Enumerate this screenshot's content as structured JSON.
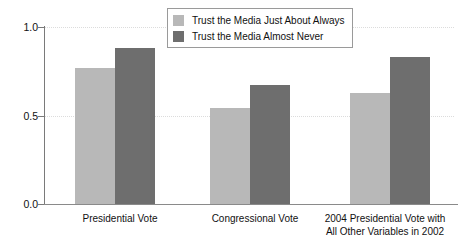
{
  "chart_data": {
    "type": "bar",
    "title": "",
    "xlabel": "",
    "ylabel": "Effect of Party Identification on Vote Choice",
    "ylim": [
      0.0,
      1.0
    ],
    "yticks": [
      "0.0",
      "0.5",
      "1.0"
    ],
    "grid": true,
    "legend_position": "top-center",
    "categories": [
      "Presidential Vote",
      "Congressional Vote",
      "2004 Presidential Vote with\nAll Other Variables in 2002"
    ],
    "category_lines": [
      [
        "Presidential Vote"
      ],
      [
        "Congressional Vote"
      ],
      [
        "2004 Presidential Vote with",
        "All Other Variables in 2002"
      ]
    ],
    "series": [
      {
        "name": "Trust the Media Just About Always",
        "color": "#b8b8b8",
        "values": [
          0.77,
          0.545,
          0.63
        ]
      },
      {
        "name": "Trust the Media Almost Never",
        "color": "#6e6e6e",
        "values": [
          0.88,
          0.675,
          0.83
        ]
      }
    ]
  },
  "legend": {
    "items": [
      {
        "label": "Trust the Media Just About Always",
        "color": "#b8b8b8"
      },
      {
        "label": "Trust the Media Almost Never",
        "color": "#6e6e6e"
      }
    ]
  },
  "axes": {
    "y_title": "Effect of Party Identification on Vote Choice",
    "y_tick_labels": [
      "1.0",
      "0.5",
      "0.0"
    ],
    "x_tick_labels": [
      "Presidential Vote",
      "Congressional Vote",
      "2004 Presidential Vote with",
      "All Other Variables in 2002"
    ]
  }
}
